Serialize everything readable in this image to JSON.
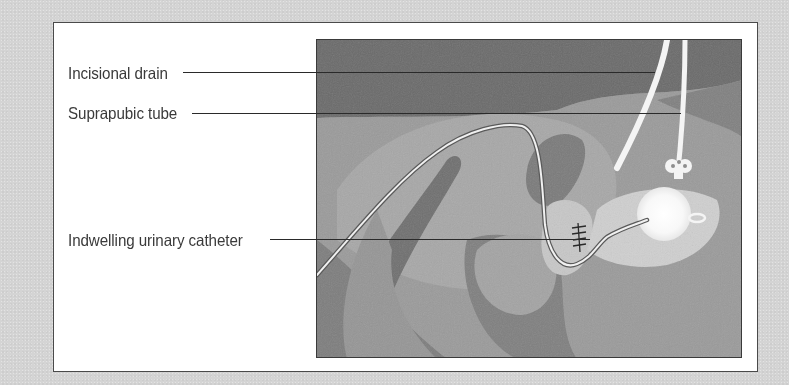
{
  "figure": {
    "labels": [
      {
        "id": "incisional-drain",
        "text": "Incisional drain"
      },
      {
        "id": "suprapubic-tube",
        "text": "Suprapubic tube"
      },
      {
        "id": "indwelling-urinary-catheter",
        "text": "Indwelling urinary catheter"
      }
    ],
    "colors": {
      "page_background": "#d4d4d4",
      "frame_background": "#ffffff",
      "frame_border": "#4a4a4a",
      "label_text": "#3a3a3a",
      "leader_line": "#2a2a2a",
      "illustration_base": "#8c8c8c",
      "tube_white": "#f4f4f4"
    }
  }
}
